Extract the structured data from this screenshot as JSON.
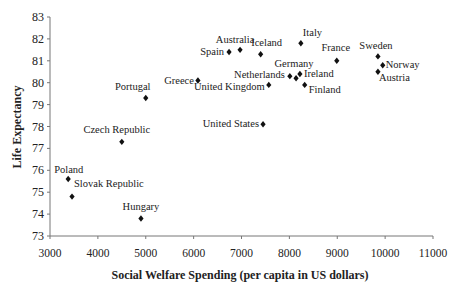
{
  "chart_data": {
    "type": "scatter",
    "title": "",
    "xlabel": "Social Welfare Spending (per capita in US dollars)",
    "ylabel": "Life Expectancy",
    "xlim": [
      3000,
      11000
    ],
    "ylim": [
      73,
      83
    ],
    "xticks": [
      3000,
      4000,
      5000,
      6000,
      7000,
      8000,
      9000,
      10000,
      11000
    ],
    "yticks": [
      73,
      74,
      75,
      76,
      77,
      78,
      79,
      80,
      81,
      82,
      83
    ],
    "grid": false,
    "legend": null,
    "marker": "diamond",
    "points": [
      {
        "label": "Poland",
        "x": 3380,
        "y": 75.6,
        "lx": -14,
        "ly": -6,
        "anchor": "start"
      },
      {
        "label": "Slovak Republic",
        "x": 3460,
        "y": 74.8,
        "lx": 2,
        "ly": -10,
        "anchor": "start"
      },
      {
        "label": "Hungary",
        "x": 4900,
        "y": 73.8,
        "lx": 0,
        "ly": -8,
        "anchor": "middle"
      },
      {
        "label": "Czech Republic",
        "x": 4500,
        "y": 77.3,
        "lx": -5,
        "ly": -9,
        "anchor": "middle"
      },
      {
        "label": "Portugal",
        "x": 5000,
        "y": 79.3,
        "lx": -13,
        "ly": -8,
        "anchor": "middle"
      },
      {
        "label": "Greece",
        "x": 6090,
        "y": 80.1,
        "lx": -4,
        "ly": 3,
        "anchor": "end"
      },
      {
        "label": "Spain",
        "x": 6740,
        "y": 81.4,
        "lx": -5,
        "ly": 3,
        "anchor": "end"
      },
      {
        "label": "Australia",
        "x": 6970,
        "y": 81.5,
        "lx": -5,
        "ly": -7,
        "anchor": "middle"
      },
      {
        "label": "Iceland",
        "x": 7400,
        "y": 81.3,
        "lx": 6,
        "ly": -8,
        "anchor": "middle"
      },
      {
        "label": "United Kingdom",
        "x": 7570,
        "y": 79.9,
        "lx": -4,
        "ly": 5,
        "anchor": "end"
      },
      {
        "label": "United States",
        "x": 7450,
        "y": 78.1,
        "lx": -4,
        "ly": 3,
        "anchor": "end"
      },
      {
        "label": "Italy",
        "x": 8240,
        "y": 81.8,
        "lx": 2,
        "ly": -7,
        "anchor": "start"
      },
      {
        "label": "Netherlands",
        "x": 8010,
        "y": 80.3,
        "lx": -5,
        "ly": 2,
        "anchor": "end"
      },
      {
        "label": "Germany",
        "x": 8140,
        "y": 80.2,
        "lx": -2,
        "ly": -11,
        "anchor": "middle"
      },
      {
        "label": "Ireland",
        "x": 8220,
        "y": 80.4,
        "lx": 4,
        "ly": 3,
        "anchor": "start"
      },
      {
        "label": "Finland",
        "x": 8320,
        "y": 79.9,
        "lx": 4,
        "ly": 8,
        "anchor": "start"
      },
      {
        "label": "France",
        "x": 8990,
        "y": 81.0,
        "lx": -1,
        "ly": -10,
        "anchor": "middle"
      },
      {
        "label": "Sweden",
        "x": 9850,
        "y": 81.2,
        "lx": -2,
        "ly": -7,
        "anchor": "middle"
      },
      {
        "label": "Norway",
        "x": 9950,
        "y": 80.8,
        "lx": 3,
        "ly": 3,
        "anchor": "start"
      },
      {
        "label": "Austria",
        "x": 9850,
        "y": 80.5,
        "lx": 1,
        "ly": 9,
        "anchor": "start"
      }
    ],
    "colors": {
      "marker": "#111111",
      "axis": "#777777",
      "text": "#222222"
    }
  }
}
